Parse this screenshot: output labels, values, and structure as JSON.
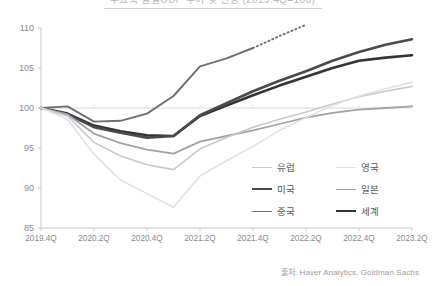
{
  "title": {
    "text": "주요국 실질GDP 추이 및 전망 (2019.4Q=100)",
    "clipped": true
  },
  "source": {
    "text": "출처: Haver Analytics, Goldman Sachs"
  },
  "legend": {
    "position": "inside-bottom-right",
    "columns": 2,
    "items": [
      {
        "label": "유럽",
        "key": "europe",
        "color": "#c9c9cd",
        "width": 1.6
      },
      {
        "label": "영국",
        "key": "uk",
        "color": "#e2e2e6",
        "width": 1.6
      },
      {
        "label": "미국",
        "key": "usa",
        "color": "#4a4a4e",
        "width": 2.6
      },
      {
        "label": "일본",
        "key": "japan",
        "color": "#a2a2a7",
        "width": 1.8
      },
      {
        "label": "중국",
        "key": "china",
        "color": "#6f6f74",
        "width": 1.9
      },
      {
        "label": "세계",
        "key": "world",
        "color": "#333337",
        "width": 2.6
      }
    ]
  },
  "axes": {
    "y": {
      "label": "",
      "min": 85,
      "max": 110,
      "ticks": [
        85,
        90,
        95,
        100,
        105,
        110
      ],
      "tick_labels": [
        "85",
        "90",
        "95",
        "100",
        "105",
        "110"
      ]
    },
    "x": {
      "label": "",
      "tick_labels": [
        "2019.4Q",
        "2020.2Q",
        "2020.4Q",
        "2021.2Q",
        "2021.4Q",
        "2022.2Q",
        "2022.4Q",
        "2023.2Q"
      ]
    },
    "baseline": 100,
    "grid": "minor-ticks-only"
  },
  "chart_data": {
    "type": "line",
    "title": "주요국 실질GDP 추이 및 전망 (2019.4Q=100)",
    "xlabel": "",
    "ylabel": "",
    "ylim": [
      85,
      110
    ],
    "grid": false,
    "legend_position": "inside-bottom-right",
    "x": [
      "2019.4Q",
      "2020.1Q",
      "2020.2Q",
      "2020.3Q",
      "2020.4Q",
      "2021.1Q",
      "2021.2Q",
      "2021.3Q",
      "2021.4Q",
      "2022.1Q",
      "2022.2Q",
      "2022.3Q",
      "2022.4Q",
      "2023.1Q",
      "2023.2Q"
    ],
    "x_tick_labels": [
      "2019.4Q",
      "2020.2Q",
      "2020.4Q",
      "2021.2Q",
      "2021.4Q",
      "2022.2Q",
      "2022.4Q",
      "2023.2Q"
    ],
    "series": [
      {
        "name": "세계",
        "key": "world",
        "color": "#333337",
        "width": 2.6,
        "values": [
          100.0,
          99.3,
          97.8,
          97.1,
          96.6,
          96.5,
          99.0,
          100.3,
          101.6,
          102.8,
          103.9,
          105.0,
          105.9,
          106.3,
          106.6
        ]
      },
      {
        "name": "미국",
        "key": "usa",
        "color": "#4a4a4e",
        "width": 2.6,
        "values": [
          100.0,
          99.2,
          97.6,
          96.9,
          96.3,
          96.5,
          99.1,
          100.6,
          102.1,
          103.4,
          104.6,
          105.9,
          107.0,
          107.9,
          108.6
        ]
      },
      {
        "name": "중국",
        "key": "china",
        "color": "#6f6f74",
        "width": 1.9,
        "values": [
          100.0,
          100.2,
          98.3,
          98.4,
          99.3,
          101.5,
          105.2,
          106.2,
          107.5,
          109.0,
          110.4,
          null,
          null,
          null,
          null
        ],
        "forecast_from": "2021.4Q",
        "forecast_dotted": true,
        "note": "line exits top of plot area; tail drawn dotted"
      },
      {
        "name": "일본",
        "key": "japan",
        "color": "#a2a2a7",
        "width": 1.8,
        "values": [
          100.0,
          99.2,
          96.8,
          95.6,
          94.8,
          94.3,
          95.8,
          96.5,
          97.2,
          98.0,
          98.8,
          99.4,
          99.8,
          100.0,
          100.2
        ]
      },
      {
        "name": "유럽",
        "key": "europe",
        "color": "#c9c9cd",
        "width": 1.6,
        "values": [
          100.0,
          99.0,
          95.7,
          94.0,
          92.9,
          92.3,
          94.9,
          96.3,
          97.6,
          98.6,
          99.5,
          100.5,
          101.4,
          102.1,
          102.7
        ]
      },
      {
        "name": "영국",
        "key": "uk",
        "color": "#e2e2e6",
        "width": 1.6,
        "values": [
          100.0,
          98.6,
          94.2,
          91.0,
          89.3,
          87.6,
          91.5,
          93.4,
          95.2,
          97.2,
          98.8,
          100.3,
          101.5,
          102.4,
          103.2
        ]
      }
    ],
    "annotations": [
      {
        "text": "2019.4Q = 100 기준선",
        "y": 100,
        "type": "baseline"
      }
    ]
  },
  "colors": {
    "axis": "#c9c9cd",
    "tick_text": "#8a8a8f",
    "baseline": "#d8d8dc",
    "source_text": "#9a9a9f"
  }
}
